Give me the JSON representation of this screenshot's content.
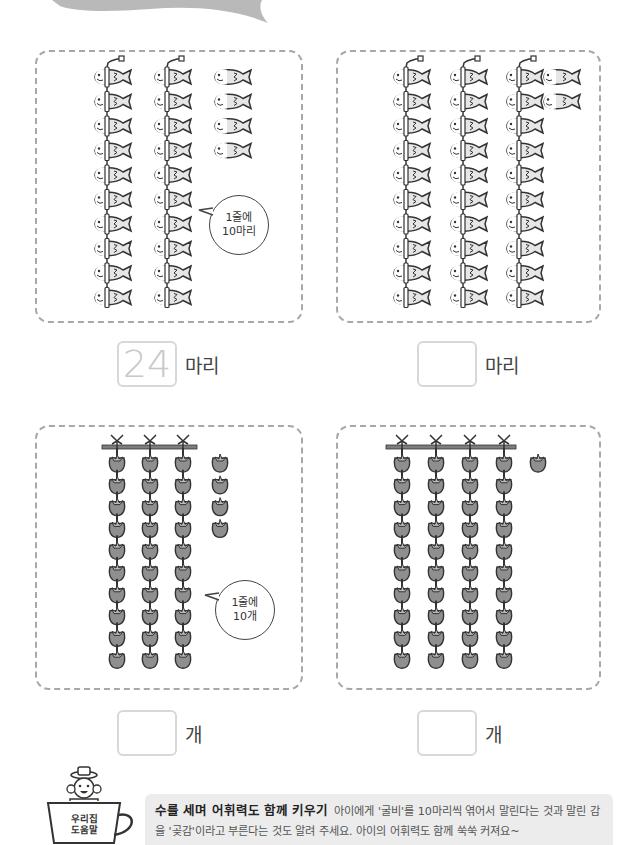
{
  "page": {
    "banner": {
      "shape": "swoosh",
      "color": "#b9b9b9"
    }
  },
  "colors": {
    "panel_border": "#a8a8a8",
    "fish_body_fill": "#e6e6e6",
    "persimmon_fill": "#8f8f8f",
    "rod_color": "#7d7d7d",
    "answer_box_border": "#d8d8d8",
    "tip_background": "#ececec"
  },
  "problems": [
    {
      "id": "fish-example",
      "item": "dried-croaker-fish",
      "strung_columns": 2,
      "per_column": 10,
      "loose": 4,
      "bubble": {
        "line1": "1줄에",
        "line2": "10마리"
      },
      "answer": {
        "value": "24",
        "unit": "마리"
      }
    },
    {
      "id": "fish-exercise",
      "item": "dried-croaker-fish",
      "strung_columns": 3,
      "per_column": 10,
      "loose": 2,
      "answer": {
        "value": "",
        "unit": "마리"
      }
    },
    {
      "id": "persimmon-example",
      "item": "dried-persimmon",
      "strung_columns": 3,
      "per_column": 10,
      "loose": 4,
      "bubble": {
        "line1": "1줄에",
        "line2": "10개"
      },
      "answer": {
        "value": "",
        "unit": "개"
      }
    },
    {
      "id": "persimmon-exercise",
      "item": "dried-persimmon",
      "strung_columns": 4,
      "per_column": 10,
      "loose": 1,
      "answer": {
        "value": "",
        "unit": "개"
      }
    }
  ],
  "tip": {
    "cup_label_line1": "우리집",
    "cup_label_line2": "도움말",
    "title": "수를 세며 어휘력도 함께 키우기",
    "body": "아이에게 '굴비'를 10마리씩 엮어서 말린다는 것과 말린 감을 '곶감'이라고 부른다는 것도 알려 주세요. 아이의 어휘력도 함께 쑥쑥 커져요~"
  }
}
